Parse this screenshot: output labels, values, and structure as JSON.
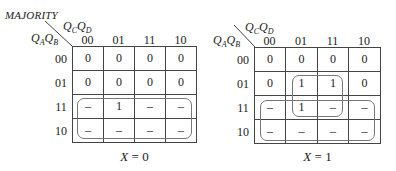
{
  "title": "MAJORITY",
  "row_var": {
    "a": "Q",
    "a_sub": "A",
    "b": "Q",
    "b_sub": "B"
  },
  "col_var": {
    "a": "Q",
    "a_sub": "C",
    "b": "Q",
    "b_sub": "D"
  },
  "col_labels": [
    "00",
    "01",
    "11",
    "10"
  ],
  "row_labels": [
    "00",
    "01",
    "11",
    "10"
  ],
  "maps": [
    {
      "caption_var": "X",
      "caption_eq": " = 0",
      "cells": [
        [
          "0",
          "0",
          "0",
          "0"
        ],
        [
          "0",
          "0",
          "0",
          "0"
        ],
        [
          "–",
          "1",
          "–",
          "–"
        ],
        [
          "–",
          "–",
          "–",
          "–"
        ]
      ]
    },
    {
      "caption_var": "X",
      "caption_eq": " = 1",
      "cells": [
        [
          "0",
          "0",
          "0",
          "0"
        ],
        [
          "0",
          "1",
          "1",
          "0"
        ],
        [
          "–",
          "1",
          "–",
          "–"
        ],
        [
          "–",
          "–",
          "–",
          "–"
        ]
      ]
    }
  ]
}
